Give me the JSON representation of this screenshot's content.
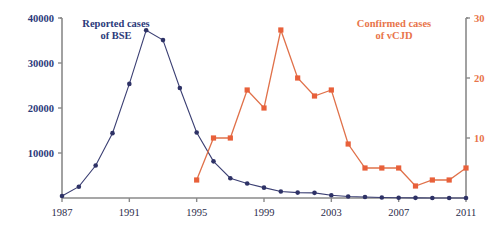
{
  "chart_data": {
    "type": "line",
    "title": "",
    "xlabel": "",
    "grid": false,
    "legend_position": "inside",
    "x_axis": {
      "min": 1987,
      "max": 2011,
      "tick_labels": [
        "1987",
        "1991",
        "1995",
        "1999",
        "2003",
        "2007",
        "2011"
      ],
      "tick_values": [
        1987,
        1991,
        1995,
        1999,
        2003,
        2007,
        2011
      ]
    },
    "y_axis_left": {
      "label": "Reported cases of BSE",
      "min": 0,
      "max": 40000,
      "tick_labels": [
        "10000",
        "20000",
        "30000",
        "40000"
      ],
      "tick_values": [
        10000,
        20000,
        30000,
        40000
      ],
      "color": "#2b3a7a"
    },
    "y_axis_right": {
      "label": "Confirmed cases of vCJD",
      "min": 0,
      "max": 30,
      "tick_labels": [
        "10",
        "20",
        "30"
      ],
      "tick_values": [
        10,
        20,
        30
      ],
      "color": "#e8744a"
    },
    "series": [
      {
        "name": "Reported cases of BSE",
        "axis": "left",
        "color": "#2e3266",
        "marker": "circle",
        "x": [
          1987,
          1988,
          1989,
          1990,
          1991,
          1992,
          1993,
          1994,
          1995,
          1996,
          1997,
          1998,
          1999,
          2000,
          2001,
          2002,
          2003,
          2004,
          2005,
          2006,
          2007,
          2008,
          2009,
          2010,
          2011
        ],
        "values": [
          446,
          2514,
          7228,
          14407,
          25359,
          37280,
          35090,
          24438,
          14562,
          8149,
          4393,
          3235,
          2301,
          1443,
          1202,
          1144,
          611,
          343,
          225,
          114,
          67,
          37,
          12,
          11,
          7
        ]
      },
      {
        "name": "Confirmed cases of vCJD",
        "axis": "right",
        "color": "#e8603a",
        "marker": "square",
        "x": [
          1995,
          1996,
          1997,
          1998,
          1999,
          2000,
          2001,
          2002,
          2003,
          2004,
          2005,
          2006,
          2007,
          2008,
          2009,
          2010,
          2011
        ],
        "values": [
          3,
          10,
          10,
          18,
          15,
          28,
          20,
          17,
          18,
          9,
          5,
          5,
          5,
          2,
          3,
          3,
          5
        ]
      }
    ]
  },
  "legend": {
    "bse_line1": "Reported cases",
    "bse_line2": "of BSE",
    "vcjd_line1": "Confirmed cases",
    "vcjd_line2": "of vCJD"
  },
  "colors": {
    "bse": "#2e3266",
    "vcjd": "#e8603a",
    "bse_text": "#2b3a7a",
    "vcjd_text": "#e8744a",
    "axis": "#8a8a8a"
  }
}
